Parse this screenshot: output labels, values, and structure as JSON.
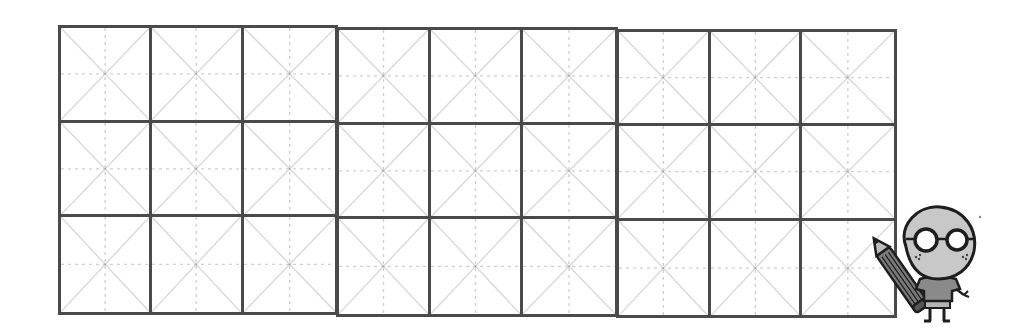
{
  "worksheet": {
    "type": "rice-grid-writing-practice",
    "rows": 3,
    "columns": 9,
    "blocks": [
      {
        "id": "block-1",
        "rows": 3,
        "columns": 3
      },
      {
        "id": "block-2",
        "rows": 3,
        "columns": 3
      },
      {
        "id": "block-3",
        "rows": 3,
        "columns": 3
      }
    ],
    "cell_guides": [
      "diagonal-lines",
      "dotted-center-cross",
      "center-dot"
    ],
    "colors": {
      "border": "#4a4a4a",
      "diagonal": "#d6d6d6",
      "dotted_cross": "#cfcfcf",
      "background": "#ffffff"
    }
  },
  "mascot": {
    "description": "cartoon character with round glasses holding a pencil",
    "icon": "student-mascot-icon",
    "colors": {
      "face": "#c8c8c8",
      "outline": "#1e1e1e",
      "shirt": "#8a8a8a",
      "pencil": "#777777"
    }
  }
}
